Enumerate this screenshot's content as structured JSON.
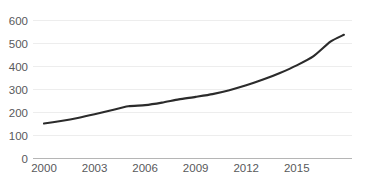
{
  "chart_data": {
    "type": "line",
    "title": "",
    "subtitle": "",
    "xlabel": "",
    "ylabel": "",
    "xlim": [
      2000,
      2017.8
    ],
    "ylim": [
      0,
      600
    ],
    "grid": true,
    "legend": false,
    "legend_position": "none",
    "y_ticks": [
      0,
      100,
      200,
      300,
      400,
      500,
      600
    ],
    "y_tick_labels": [
      "0",
      "100",
      "200",
      "300",
      "400",
      "500",
      "600"
    ],
    "x_ticks": [
      2000,
      2003,
      2006,
      2009,
      2012,
      2015
    ],
    "x_tick_labels": [
      "2000",
      "2003",
      "2006",
      "2009",
      "2012",
      "2015"
    ],
    "x": [
      2000,
      2001,
      2002,
      2003,
      2004,
      2005,
      2006,
      2007,
      2008,
      2009,
      2010,
      2011,
      2012,
      2013,
      2014,
      2015,
      2016,
      2017,
      2017.8
    ],
    "series": [
      {
        "name": "series-1",
        "color": "#2b2b2b",
        "values": [
          152,
          163,
          176,
          192,
          210,
          227,
          232,
          243,
          257,
          268,
          280,
          297,
          318,
          343,
          372,
          405,
          445,
          508,
          538
        ]
      }
    ],
    "colors": {
      "line": "#2b2b2b",
      "gridline": "#e8e8e8",
      "axis": "#b5b5b5",
      "tick_text": "#58595b",
      "background": "#ffffff"
    }
  }
}
